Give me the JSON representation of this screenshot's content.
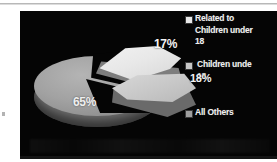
{
  "chart_data": {
    "type": "pie",
    "title": "",
    "subtitle": "",
    "xlabel": "",
    "ylabel": "",
    "exploded": true,
    "three_d": true,
    "legend_position": "right",
    "grid": false,
    "background_color": "#050505",
    "categories": [
      "Related to Children under 18",
      "Children under 18",
      "All Others"
    ],
    "values": [
      17,
      18,
      65
    ],
    "value_labels": [
      "17%",
      "18%",
      "65%"
    ],
    "slice_colors": [
      "#e8e8e8",
      "#c6c6c6",
      "#a2a2a2"
    ],
    "slices": [
      {
        "label": "Related to Children under 18",
        "value": 17,
        "display": "17%",
        "color": "#e8e8e8"
      },
      {
        "label": "Children under 18",
        "value": 18,
        "display": "18%",
        "color": "#c6c6c6"
      },
      {
        "label": "All Others",
        "value": 65,
        "display": "65%",
        "color": "#a2a2a2"
      }
    ]
  },
  "chart": {
    "labels": {
      "slice_17": "17%",
      "slice_18": "18%",
      "slice_65": "65%"
    }
  },
  "legend": {
    "items": [
      {
        "label": "Related to\nChildren under\n18",
        "color": "#e8e8e8"
      },
      {
        "label": "Children unde\n18",
        "color": "#c6c6c6"
      },
      {
        "label": "All Others",
        "color": "#9e9e9e"
      }
    ]
  }
}
